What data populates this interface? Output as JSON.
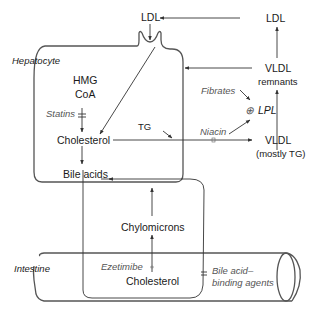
{
  "diagram": {
    "compartments": {
      "hepatocyte": "Hepatocyte",
      "intestine": "Intestine"
    },
    "nodes": {
      "ldl_receptor": "LDL",
      "ldl_plasma": "LDL",
      "hmg_line1": "HMG",
      "hmg_line2": "CoA",
      "cholesterol_liver": "Cholesterol",
      "bile_acids": "Bile acids",
      "tg": "TG",
      "vldl_remnants_line1": "VLDL",
      "vldl_remnants_line2": "remnants",
      "vldl_line1": "VLDL",
      "vldl_line2": "(mostly TG)",
      "lpl": "LPL",
      "lpl_symbol": "⊕",
      "chylomicrons": "Chylomicrons",
      "cholesterol_gut": "Cholesterol"
    },
    "drugs": {
      "statins": "Statins",
      "fibrates": "Fibrates",
      "niacin": "Niacin",
      "ezetimibe": "Ezetimibe",
      "bile_binders_line1": "Bile acid–",
      "bile_binders_line2": "binding agents"
    },
    "colors": {
      "line": "#333333",
      "membrane": "#555555",
      "drug_text": "#555555",
      "text": "#1a1a1a"
    }
  }
}
